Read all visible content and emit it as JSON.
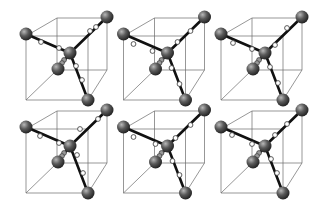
{
  "figure": {
    "background_color": "#ffffff",
    "grid": {
      "rows": 2,
      "cols": 3,
      "col_offset": 97.5,
      "row_offset": 93
    },
    "colors": {
      "cube_edge": "#6a6a6a",
      "bond": "#111111",
      "large_atom_light": "#9a9a9a",
      "large_atom_dark": "#1e1e1e",
      "small_atom": "#ffffff"
    },
    "cube": {
      "front": [
        [
          26,
          36
        ],
        [
          88,
          36
        ],
        [
          88,
          100
        ],
        [
          26,
          100
        ]
      ],
      "back": [
        [
          57,
          18
        ],
        [
          107,
          18
        ],
        [
          107,
          70
        ],
        [
          57,
          70
        ]
      ]
    },
    "large_atoms": [
      {
        "name": "corner-front-top-left",
        "x": 26,
        "y": 34,
        "r": 6.5
      },
      {
        "name": "corner-back-top-right",
        "x": 107,
        "y": 17,
        "r": 6.5
      },
      {
        "name": "corner-front-bottom-right",
        "x": 88,
        "y": 100,
        "r": 6.5
      },
      {
        "name": "corner-back-bottom-left",
        "x": 58,
        "y": 69,
        "r": 6.5
      },
      {
        "name": "center",
        "x": 70,
        "y": 53,
        "r": 6.5
      }
    ],
    "bonds": [
      {
        "from": "center",
        "to": "corner-front-top-left"
      },
      {
        "from": "center",
        "to": "corner-back-top-right"
      },
      {
        "from": "center",
        "to": "corner-front-bottom-right"
      },
      {
        "from": "center",
        "to": "corner-back-bottom-left"
      }
    ],
    "cells": [
      {
        "id": "r1c1",
        "small_atoms": [
          [
            41,
            42
          ],
          [
            59,
            48
          ],
          [
            90,
            31
          ],
          [
            96,
            27
          ],
          [
            76,
            66
          ],
          [
            82,
            80
          ],
          [
            64,
            60
          ],
          [
            62,
            63
          ]
        ]
      },
      {
        "id": "r1c2",
        "small_atoms": [
          [
            36,
            44
          ],
          [
            55,
            51
          ],
          [
            80,
            42
          ],
          [
            93,
            31
          ],
          [
            74,
            68
          ],
          [
            82,
            84
          ],
          [
            64,
            60
          ],
          [
            62,
            63
          ]
        ]
      },
      {
        "id": "r1c3",
        "small_atoms": [
          [
            38,
            43
          ],
          [
            57,
            49
          ],
          [
            80,
            45
          ],
          [
            92,
            28
          ],
          [
            75,
            67
          ],
          [
            83,
            83
          ],
          [
            64,
            60
          ],
          [
            62,
            63
          ]
        ]
      },
      {
        "id": "r2c1",
        "small_atoms": [
          [
            40,
            43
          ],
          [
            59,
            50
          ],
          [
            80,
            36
          ],
          [
            98,
            26
          ],
          [
            77,
            62
          ],
          [
            83,
            80
          ],
          [
            64,
            60
          ],
          [
            62,
            63
          ]
        ]
      },
      {
        "id": "r2c2",
        "small_atoms": [
          [
            36,
            44
          ],
          [
            58,
            51
          ],
          [
            78,
            45
          ],
          [
            93,
            32
          ],
          [
            75,
            68
          ],
          [
            82,
            82
          ],
          [
            64,
            60
          ],
          [
            62,
            63
          ]
        ]
      },
      {
        "id": "r2c3",
        "small_atoms": [
          [
            37,
            42
          ],
          [
            57,
            51
          ],
          [
            80,
            42
          ],
          [
            92,
            31
          ],
          [
            76,
            66
          ],
          [
            82,
            80
          ],
          [
            64,
            60
          ],
          [
            62,
            63
          ]
        ]
      }
    ]
  }
}
